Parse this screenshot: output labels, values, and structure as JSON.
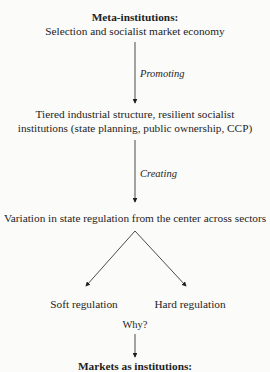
{
  "diagram": {
    "top": {
      "title": "Meta-institutions:",
      "subtitle": "Selection and socialist market economy"
    },
    "edge_1_label": "Promoting",
    "second": {
      "line1": "Tiered industrial structure, resilient socialist",
      "line2": "institutions (state planning, public ownership, CCP)"
    },
    "edge_2_label": "Creating",
    "third": "Variation in state regulation from the center across sectors",
    "branches": {
      "left": "Soft regulation",
      "right": "Hard regulation"
    },
    "question": "Why?",
    "bottom": {
      "title": "Markets as institutions:"
    }
  }
}
